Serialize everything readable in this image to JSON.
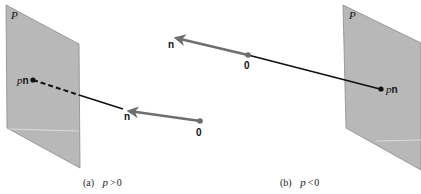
{
  "figure": {
    "panels": [
      {
        "id": "a",
        "plane_label": "P",
        "point_label_scalar": "p",
        "point_label_vector": "n",
        "normal_label": "n",
        "origin_label": "0",
        "caption_prefix": "(a)",
        "caption_var": "p",
        "caption_rel": ">",
        "caption_value": "0"
      },
      {
        "id": "b",
        "plane_label": "P",
        "point_label_scalar": "p",
        "point_label_vector": "n",
        "normal_label": "n",
        "origin_label": "0",
        "caption_prefix": "(b)",
        "caption_var": "p",
        "caption_rel": "<",
        "caption_value": "0"
      }
    ],
    "colors": {
      "plane_fill": "#b8b8b8",
      "plane_edge": "#8a8a8a",
      "normal_vector": "#6e6e6e",
      "line": "#111111"
    }
  }
}
